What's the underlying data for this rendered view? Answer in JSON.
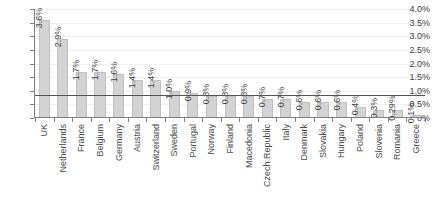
{
  "chart_data": {
    "type": "bar",
    "title": "",
    "subtitle": "",
    "xlabel": "",
    "ylabel": "",
    "ylim": [
      0,
      4.0
    ],
    "grid": true,
    "legend": false,
    "orientation": "vertical",
    "y_tick_labels": [
      "4.0%",
      "3.5%",
      "3.0%",
      "2.5%",
      "2.0%",
      "1.5%",
      "1.0%",
      "0.5%",
      "0%"
    ],
    "y_tick_values": [
      4.0,
      3.5,
      3.0,
      2.5,
      2.0,
      1.5,
      1.0,
      0.5,
      0
    ],
    "reference_line": {
      "value": 0.85,
      "label": ""
    },
    "categories": [
      "UK",
      "Netherlands",
      "France",
      "Belgium",
      "Germany",
      "Austria",
      "Switzerland",
      "Sweden",
      "Portugal",
      "Norway",
      "Finland",
      "Macedonia",
      "Czech Republic",
      "Italy",
      "Denmark",
      "Slovakia",
      "Hungary",
      "Poland",
      "Slovenia",
      "Romania",
      "Greece"
    ],
    "values": [
      3.6,
      2.9,
      1.7,
      1.7,
      1.6,
      1.4,
      1.4,
      1.0,
      0.9,
      0.8,
      0.8,
      0.8,
      0.7,
      0.7,
      0.6,
      0.6,
      0.6,
      0.4,
      0.3,
      0.29,
      0.1
    ],
    "value_labels": [
      "3.6%",
      "2.9%",
      "1.7%",
      "1.7%",
      "1.6%",
      "1.4%",
      "1.4%",
      "1.0%",
      "0.9%",
      "0.8%",
      "0.8%",
      "0.8%",
      "0.7%",
      "0.7%",
      "0.6%",
      "0.6%",
      "0.6%",
      "0.4%",
      "0.3%",
      "0.29%",
      "0.1%"
    ],
    "colors": {
      "bar_fill": "#d3d3d3",
      "bar_stroke": "#c0c0c0",
      "gridline": "#f0f0f0",
      "axis": "#808080",
      "reference_line": "#555555",
      "text": "#404040",
      "background": "#ffffff"
    }
  }
}
